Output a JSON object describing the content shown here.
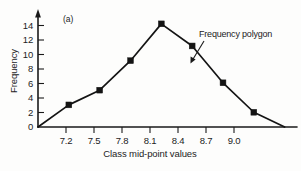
{
  "figure": {
    "panel_label": "(a)",
    "background_color": "#fdfdfc",
    "line_color": "#141414"
  },
  "chart_data": {
    "type": "line",
    "title": "",
    "subtitle": "",
    "panel_label": "(a)",
    "xlabel": "Class mid-point values",
    "ylabel": "Frequency",
    "x": [
      6.9,
      7.2,
      7.5,
      7.8,
      8.1,
      8.4,
      8.7,
      9.0,
      9.3
    ],
    "values": [
      0,
      3,
      5,
      9,
      14,
      11,
      6,
      2,
      0
    ],
    "series": [
      {
        "name": "Frequency polygon",
        "x": [
          6.9,
          7.2,
          7.5,
          7.8,
          8.1,
          8.4,
          8.7,
          9.0,
          9.3
        ],
        "values": [
          0,
          3,
          5,
          9,
          14,
          11,
          6,
          2,
          0
        ]
      }
    ],
    "xlim": [
      6.9,
      9.42
    ],
    "ylim": [
      0,
      15.2
    ],
    "xticks": [
      7.2,
      7.5,
      7.8,
      8.1,
      8.4,
      8.7,
      9.0
    ],
    "xticklabels": [
      "7.2",
      "7.5",
      "7.8",
      "8.1",
      "8.4",
      "8.7",
      "9.0"
    ],
    "yticks": [
      0,
      2,
      4,
      6,
      8,
      10,
      12,
      14
    ],
    "yticklabels": [
      "0",
      "2",
      "4",
      "6",
      "8",
      "10",
      "12",
      "14"
    ],
    "grid": false,
    "legend": "none",
    "markers": "square",
    "annotations": [
      {
        "text": "Frequency polygon",
        "points_to_x": 8.55,
        "points_to_y": 8.6
      }
    ]
  },
  "axes": {
    "y_title": "Frequency",
    "x_title": "Class mid-point values",
    "y_tick_labels": [
      "14",
      "12",
      "10",
      "8",
      "6",
      "4",
      "2",
      "0"
    ],
    "x_tick_labels": [
      "7.2",
      "7.5",
      "7.8",
      "8.1",
      "8.4",
      "8.7",
      "9.0"
    ]
  },
  "annotation": {
    "label": "Frequency polygon"
  }
}
